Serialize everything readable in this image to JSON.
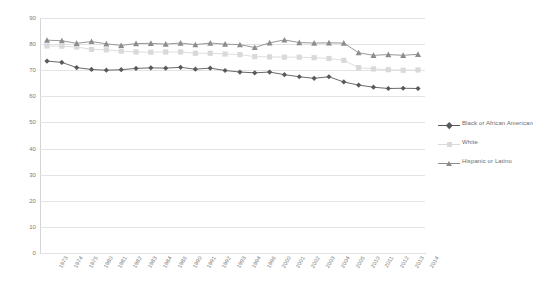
{
  "chart_data": {
    "type": "line",
    "title": "",
    "subtitle": "",
    "xlabel": "",
    "ylabel": "",
    "ylim": [
      0,
      90
    ],
    "ytick_interval": 10,
    "yticks": [
      0,
      10,
      20,
      30,
      40,
      50,
      60,
      70,
      80,
      90
    ],
    "grid": true,
    "legend_position": "right",
    "categories": [
      "1973",
      "1974",
      "1975",
      "1980",
      "1981",
      "1982",
      "1983",
      "1984",
      "1986",
      "1990",
      "1991",
      "1992",
      "1993",
      "1994",
      "1996",
      "2000",
      "2001",
      "2002",
      "2003",
      "2004",
      "2005",
      "2010",
      "2011",
      "2012",
      "2013",
      "2014"
    ],
    "series": [
      {
        "name": "Black or African American",
        "color": "#595959",
        "marker": "diamond",
        "values": [
          73.5,
          73.0,
          71.0,
          70.3,
          70.0,
          70.2,
          70.7,
          70.9,
          70.8,
          71.1,
          70.4,
          70.8,
          69.9,
          69.3,
          69.0,
          69.3,
          68.3,
          67.5,
          66.9,
          67.5,
          65.5,
          64.3,
          63.5,
          63.0,
          63.1,
          63.0
        ]
      },
      {
        "name": "White",
        "color": "#d9d9d9",
        "marker": "square",
        "values": [
          79.3,
          79.2,
          78.9,
          78.0,
          77.8,
          77.3,
          77.0,
          76.9,
          77.0,
          77.0,
          76.5,
          76.5,
          76.2,
          76.0,
          75.2,
          75.1,
          75.0,
          75.0,
          74.8,
          74.5,
          73.8,
          71.0,
          70.5,
          70.2,
          70.0,
          70.1
        ]
      },
      {
        "name": "Hispanic or Latino",
        "color": "#8c8c8c",
        "marker": "triangle",
        "values": [
          81.5,
          81.3,
          80.3,
          81.0,
          80.1,
          79.5,
          80.2,
          80.3,
          80.0,
          80.4,
          79.8,
          80.4,
          80.0,
          79.8,
          78.7,
          80.5,
          81.6,
          80.6,
          80.4,
          80.5,
          80.4,
          76.7,
          75.7,
          76.0,
          75.7,
          76.1
        ]
      }
    ]
  },
  "legend": {
    "entries": [
      {
        "label": "Black or African American"
      },
      {
        "label": "White"
      },
      {
        "label": "Hispanic or Latino"
      }
    ]
  }
}
